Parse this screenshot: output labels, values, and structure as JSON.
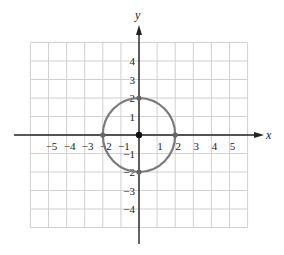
{
  "chart_data": {
    "type": "scatter",
    "title": "",
    "xlabel": "x",
    "ylabel": "y",
    "xlim": [
      -6,
      6
    ],
    "ylim": [
      -5,
      5
    ],
    "grid": true,
    "x_tick_labels": [
      "-5",
      "-4",
      "-3",
      "-2",
      "-1",
      "1",
      "2",
      "3",
      "4",
      "5"
    ],
    "y_tick_labels": [
      "4",
      "3",
      "2",
      "1",
      "-1",
      "-2",
      "-3",
      "-4"
    ],
    "curve": {
      "shape": "circle",
      "center": [
        0,
        0
      ],
      "radius": 2,
      "equation": "x^2 + y^2 = 4"
    },
    "points": [
      {
        "x": 0,
        "y": 0,
        "label": "center"
      },
      {
        "x": 2,
        "y": 0
      },
      {
        "x": -2,
        "y": 0
      },
      {
        "x": 0,
        "y": 2
      },
      {
        "x": 0,
        "y": -2
      }
    ],
    "colors": {
      "curve": "#7a7a7a",
      "grid": "#d0d0d0",
      "axes": "#222222",
      "points": "#666666"
    }
  }
}
